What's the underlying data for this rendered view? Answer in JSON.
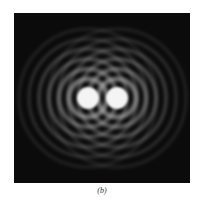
{
  "figure": {
    "caption": "(b)",
    "colors": {
      "background": "#0b0b0b",
      "disk": "#f2f2f2",
      "ring": "#6a6a6a"
    }
  }
}
